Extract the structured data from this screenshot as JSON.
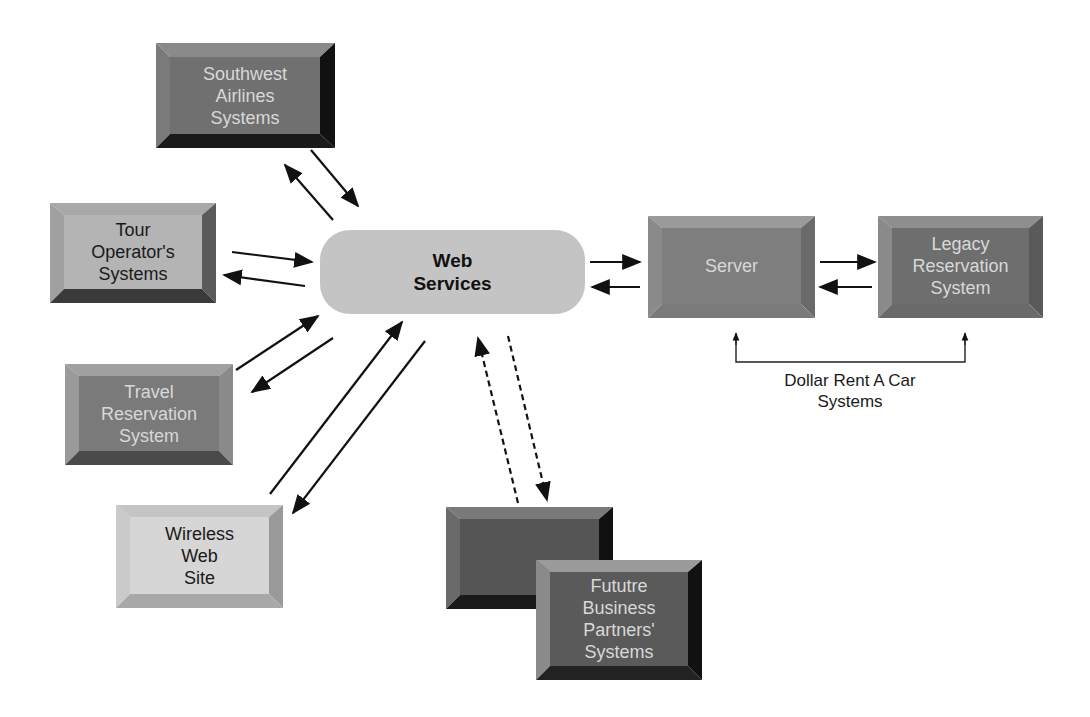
{
  "diagram": {
    "hub": {
      "label": "Web\nServices"
    },
    "nodes": [
      {
        "id": "southwest",
        "label": "Southwest\nAirlines\nSystems",
        "shade": "dark"
      },
      {
        "id": "tour",
        "label": "Tour\nOperator's\nSystems",
        "shade": "light"
      },
      {
        "id": "travel",
        "label": "Travel\nReservation\nSystem",
        "shade": "dark"
      },
      {
        "id": "wireless",
        "label": "Wireless\nWeb\nSite",
        "shade": "lighter"
      },
      {
        "id": "partners-back",
        "label": "",
        "shade": "darker"
      },
      {
        "id": "partners",
        "label": "Fututre\nBusiness\nPartners'\nSystems",
        "shade": "darker"
      },
      {
        "id": "server",
        "label": "Server",
        "shade": "dark"
      },
      {
        "id": "legacy",
        "label": "Legacy\nReservation\nSystem",
        "shade": "dark"
      }
    ],
    "group_caption": "Dollar Rent A Car\nSystems",
    "edges": [
      {
        "from": "hub",
        "to": "southwest",
        "style": "solid",
        "bidirectional": true
      },
      {
        "from": "hub",
        "to": "tour",
        "style": "solid",
        "bidirectional": true
      },
      {
        "from": "hub",
        "to": "travel",
        "style": "solid",
        "bidirectional": true
      },
      {
        "from": "hub",
        "to": "wireless",
        "style": "solid",
        "bidirectional": true
      },
      {
        "from": "hub",
        "to": "partners",
        "style": "dashed",
        "bidirectional": true
      },
      {
        "from": "hub",
        "to": "server",
        "style": "solid",
        "bidirectional": true
      },
      {
        "from": "server",
        "to": "legacy",
        "style": "solid",
        "bidirectional": true
      }
    ]
  }
}
